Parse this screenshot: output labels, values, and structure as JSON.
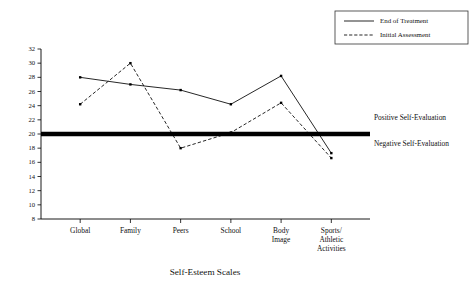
{
  "chart_data": {
    "type": "line",
    "title": "",
    "xlabel": "Self-Esteem Scales",
    "ylabel": "",
    "categories": [
      "Global",
      "Family",
      "Peers",
      "School",
      "Body\nImage",
      "Sports/\nAthletic\nActivities"
    ],
    "category_lines": [
      [
        "Global"
      ],
      [
        "Family"
      ],
      [
        "Peers"
      ],
      [
        "School"
      ],
      [
        "Body",
        "Image"
      ],
      [
        "Sports/",
        "Athletic",
        "Activities"
      ]
    ],
    "series": [
      {
        "name": "End of Treatment",
        "style": "solid",
        "values": [
          28.0,
          27.0,
          26.2,
          24.2,
          28.2,
          17.3
        ]
      },
      {
        "name": "Initial Assessment",
        "style": "dashed",
        "values": [
          24.2,
          30.0,
          18.0,
          20.2,
          24.4,
          16.6
        ]
      }
    ],
    "ylim": [
      8,
      32
    ],
    "yticks": [
      8,
      10,
      12,
      14,
      16,
      18,
      20,
      22,
      24,
      26,
      28,
      30,
      32
    ],
    "ytick_labels": [
      "8",
      "10",
      "12",
      "14",
      "16",
      "18",
      "20",
      "22",
      "24",
      "26",
      "28",
      "30",
      "32"
    ],
    "grid": false,
    "legend_position": "top-right",
    "reference_line": {
      "value": 20,
      "label_above": "Positive Self-Evaluation",
      "label_below": "Negative Self-Evaluation"
    }
  },
  "legend": {
    "entries": [
      {
        "label": "End of Treatment",
        "style": "solid"
      },
      {
        "label": "Initial Assessment",
        "style": "dashed"
      }
    ]
  },
  "annotations": {
    "positive": "Positive Self-Evaluation",
    "negative": "Negative Self-Evaluation"
  },
  "axis": {
    "x_title": "Self-Esteem Scales"
  },
  "colors": {
    "line": "#000000",
    "text": "#111111",
    "background": "#ffffff",
    "legend_border": "#333333"
  }
}
